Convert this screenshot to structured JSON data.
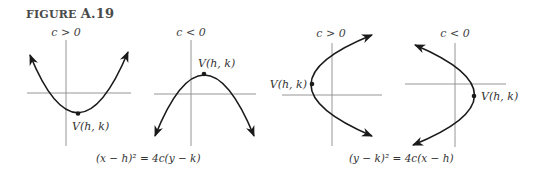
{
  "figure": {
    "label_prefix": "FIGURE",
    "label_number": "A.19"
  },
  "panels": [
    {
      "condition": "c > 0",
      "vertex_label": "V(h, k)",
      "orientation": "opens-up"
    },
    {
      "condition": "c < 0",
      "vertex_label": "V(h, k)",
      "orientation": "opens-down"
    },
    {
      "condition": "c > 0",
      "vertex_label": "V(h, k)",
      "orientation": "opens-right"
    },
    {
      "condition": "c < 0",
      "vertex_label": "V(h, k)",
      "orientation": "opens-left"
    }
  ],
  "equations": {
    "vertical": "(x − h)² = 4c(y − k)",
    "horizontal": "(y − k)² = 4c(x − h)"
  },
  "colors": {
    "curve": "#1a1a1a",
    "axis": "#8a8a8a",
    "text": "#333333"
  }
}
